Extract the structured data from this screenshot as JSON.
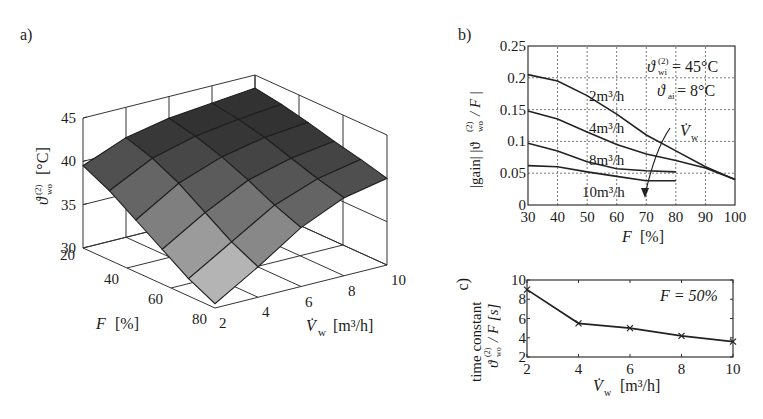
{
  "panels": {
    "a": {
      "label": "a)"
    },
    "b": {
      "label": "b)"
    },
    "c": {
      "label": "c)"
    }
  },
  "chart_data": [
    {
      "id": "a",
      "type": "surface3d",
      "title": "",
      "xlabel": "F [%]",
      "ylabel": "V̇w [m³/h]",
      "zlabel": "ϑwo(2) [°C]",
      "x_ticks": [
        "20",
        "40",
        "60",
        "80"
      ],
      "y_ticks": [
        "2",
        "4",
        "6",
        "8",
        "10"
      ],
      "z_ticks": [
        "30",
        "35",
        "40",
        "45"
      ],
      "x": [
        20,
        32,
        44,
        56,
        68,
        80
      ],
      "y": [
        2,
        4,
        6,
        8,
        10
      ],
      "zlim": [
        30,
        45
      ],
      "z": [
        [
          39.5,
          41.5,
          42.5,
          43.0,
          43.5
        ],
        [
          38.0,
          40.5,
          41.8,
          42.5,
          43.0
        ],
        [
          36.0,
          39.0,
          40.8,
          41.8,
          42.3
        ],
        [
          34.0,
          37.0,
          39.5,
          40.8,
          41.5
        ],
        [
          32.0,
          35.0,
          38.0,
          39.8,
          40.8
        ],
        [
          30.5,
          33.5,
          36.8,
          39.0,
          40.0
        ]
      ]
    },
    {
      "id": "b",
      "type": "line",
      "title": "",
      "xlabel": "F [%]",
      "ylabel": "|gain| |ϑwo(2) / F|",
      "xlim": [
        30,
        100
      ],
      "ylim": [
        0,
        0.25
      ],
      "x_ticks": [
        "30",
        "40",
        "50",
        "60",
        "70",
        "80",
        "90",
        "100"
      ],
      "y_ticks": [
        "0",
        "0.05",
        "0.1",
        "0.15",
        "0.2",
        "0.25"
      ],
      "grid": true,
      "annotations": [
        "ϑwi(2) = 45°C",
        "ϑai = 8°C",
        "V̇w"
      ],
      "series": [
        {
          "name": "2m³/h",
          "x": [
            30,
            40,
            50,
            60,
            70,
            80,
            90,
            100
          ],
          "values": [
            0.205,
            0.195,
            0.172,
            0.143,
            0.11,
            0.085,
            0.06,
            0.04
          ]
        },
        {
          "name": "4m³/h",
          "x": [
            30,
            40,
            50,
            60,
            70,
            80,
            90,
            100
          ],
          "values": [
            0.148,
            0.135,
            0.115,
            0.095,
            0.08,
            0.07,
            0.058,
            0.04
          ]
        },
        {
          "name": "8m³/h",
          "x": [
            30,
            40,
            50,
            60,
            70,
            80
          ],
          "values": [
            0.097,
            0.085,
            0.068,
            0.057,
            0.054,
            0.052
          ]
        },
        {
          "name": "10m³/h",
          "x": [
            30,
            40,
            50,
            60,
            70,
            80
          ],
          "values": [
            0.062,
            0.06,
            0.052,
            0.045,
            0.038,
            0.038
          ]
        }
      ]
    },
    {
      "id": "c",
      "type": "line",
      "title": "",
      "xlabel": "V̇w [m³/h]",
      "ylabel": "time constant ϑwo(2) / F [s]",
      "xlim": [
        2,
        10
      ],
      "ylim": [
        2,
        10
      ],
      "x_ticks": [
        "2",
        "4",
        "6",
        "8",
        "10"
      ],
      "y_ticks": [
        "2",
        "4",
        "6",
        "8",
        "10"
      ],
      "grid": false,
      "annotations": [
        "F = 50%"
      ],
      "series": [
        {
          "name": "F = 50%",
          "x": [
            2,
            4,
            6,
            8,
            10
          ],
          "values": [
            9.0,
            5.5,
            5.0,
            4.2,
            3.6
          ]
        }
      ]
    }
  ],
  "text": {
    "a_xlabel_var": "F",
    "a_xlabel_unit": "[%]",
    "a_ylabel_var": "V̇",
    "a_ylabel_sub": "w",
    "a_ylabel_unit": "[m³/h]",
    "a_zlabel_var": "ϑ",
    "a_zlabel_sup": "(2)",
    "a_zlabel_sub": "wo",
    "a_zlabel_unit": "[°C]",
    "b_xlabel_var": "F",
    "b_xlabel_unit": "[%]",
    "b_ylabel": "|gain|  |ϑ",
    "b_ylabel_sup": "(2)",
    "b_ylabel_sub": "wo",
    "b_ylabel_tail": " / F |",
    "b_ann1_var": "ϑ",
    "b_ann1_sup": "(2)",
    "b_ann1_sub": "wi",
    "b_ann1_val": " = 45°C",
    "b_ann2_var": "ϑ",
    "b_ann2_sub": "ai",
    "b_ann2_val": " = 8°C",
    "b_arrow_var": "V̇",
    "b_arrow_sub": "w",
    "c_ylabel_line1": "time constant",
    "c_ylabel_var": "ϑ",
    "c_ylabel_sup": "(2)",
    "c_ylabel_sub": "wo",
    "c_ylabel_tail": " / F  [s]",
    "c_xlabel_var": "V̇",
    "c_xlabel_sub": "w",
    "c_xlabel_unit": "[m³/h]",
    "c_ann": "F = 50%"
  }
}
